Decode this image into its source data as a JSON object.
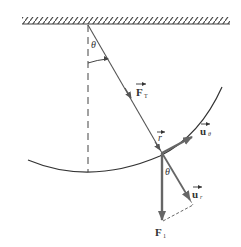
{
  "diagram": {
    "colors": {
      "line": "#444444",
      "vector": "#666666",
      "text": "#333333",
      "background": "#ffffff"
    },
    "labels": {
      "theta_top": "θ",
      "tension": "F",
      "tension_sub": "T",
      "position": "r",
      "unit_theta": "u",
      "unit_theta_sub": "θ",
      "unit_r": "u",
      "unit_r_sub": "r",
      "weight": "F",
      "weight_sub": "1",
      "theta_bottom": "θ"
    },
    "elements": [
      "ceiling-support",
      "vertical-reference-line",
      "pendulum-string",
      "circular-path-arc",
      "tension-vector",
      "position-vector",
      "unit-vector-theta",
      "unit-vector-r",
      "weight-vector",
      "component-dashed-line"
    ]
  }
}
